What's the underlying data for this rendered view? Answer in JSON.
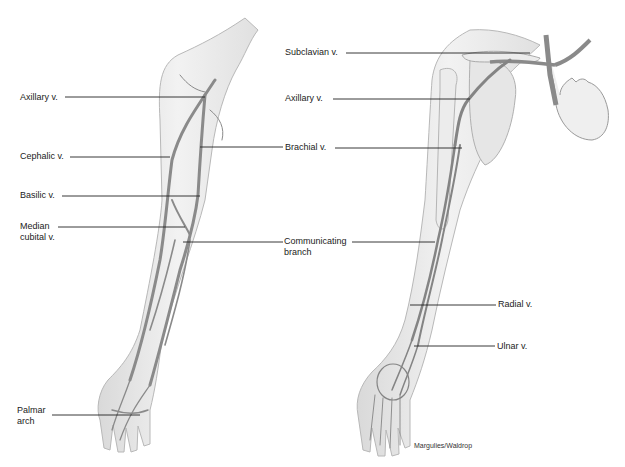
{
  "figure": {
    "left_view": {
      "labels": [
        {
          "text": "Axillary v.",
          "x": 20,
          "y": 92
        },
        {
          "text": "Cephalic v.",
          "x": 20,
          "y": 151
        },
        {
          "text": "Basilic v.",
          "x": 20,
          "y": 190
        },
        {
          "text": "Median",
          "x": 20,
          "y": 222
        },
        {
          "text": "cubital v.",
          "x": 20,
          "y": 233
        },
        {
          "text": "Palmar",
          "x": 17,
          "y": 406
        },
        {
          "text": "arch",
          "x": 17,
          "y": 417
        }
      ]
    },
    "right_view": {
      "labels": [
        {
          "text": "Subclavian v.",
          "x": 285,
          "y": 48
        },
        {
          "text": "Axillary v.",
          "x": 285,
          "y": 94
        },
        {
          "text": "Brachial v.",
          "x": 285,
          "y": 143
        },
        {
          "text": "Communicating",
          "x": 284,
          "y": 237
        },
        {
          "text": "branch",
          "x": 284,
          "y": 248
        },
        {
          "text": "Radial v.",
          "x": 498,
          "y": 299
        },
        {
          "text": "Ulnar v.",
          "x": 497,
          "y": 341
        }
      ]
    },
    "credit": "Margulies/Waldrop"
  }
}
